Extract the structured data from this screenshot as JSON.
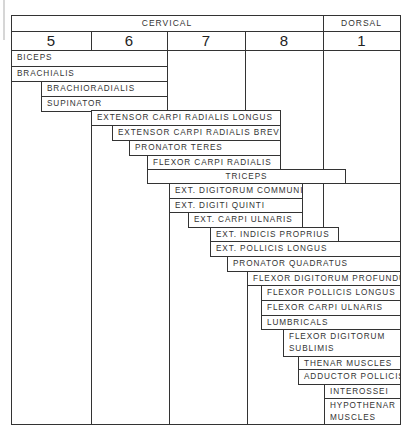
{
  "header": {
    "groups": [
      {
        "label": "CERVICAL",
        "x": 11,
        "w": 312
      },
      {
        "label": "DORSAL",
        "x": 323,
        "w": 77
      }
    ],
    "segments": [
      {
        "label": "5",
        "x": 11,
        "w": 80
      },
      {
        "label": "6",
        "x": 91,
        "w": 76
      },
      {
        "label": "7",
        "x": 167,
        "w": 78
      },
      {
        "label": "8",
        "x": 245,
        "w": 78
      },
      {
        "label": "1",
        "x": 323,
        "w": 77
      }
    ]
  },
  "muscles": [
    {
      "name": "BICEPS",
      "x1": 11,
      "x2": 167,
      "y": 50,
      "h": 17,
      "segments": "C5-C6"
    },
    {
      "name": "BRACHIALIS",
      "x1": 11,
      "x2": 167,
      "y": 66,
      "h": 16,
      "segments": "C5-C6"
    },
    {
      "name": "BRACHIORADIALIS",
      "x1": 41,
      "x2": 167,
      "y": 81,
      "h": 16,
      "segments": "C5-C6"
    },
    {
      "name": "SUPINATOR",
      "x1": 41,
      "x2": 167,
      "y": 96,
      "h": 16,
      "segments": "C5-C6"
    },
    {
      "name": "EXTENSOR CARPI RADIALIS LONGUS",
      "x1": 91,
      "x2": 280,
      "y": 110,
      "h": 16,
      "segments": "C6-C7"
    },
    {
      "name": "EXTENSOR CARPI RADIALIS BREVIS",
      "x1": 112,
      "x2": 280,
      "y": 125,
      "h": 16,
      "segments": "C6-C7"
    },
    {
      "name": "PRONATOR TERES",
      "x1": 129,
      "x2": 280,
      "y": 140,
      "h": 16,
      "segments": "C6-C7"
    },
    {
      "name": "FLEXOR CARPI RADIALIS",
      "x1": 147,
      "x2": 280,
      "y": 155,
      "h": 15,
      "segments": "C6-C7"
    },
    {
      "name": "TRICEPS",
      "x1": 147,
      "x2": 345,
      "y": 169,
      "h": 15,
      "segments": "C6-C8",
      "center": true
    },
    {
      "name": "EXT. DIGITORUM COMMUNIS",
      "x1": 169,
      "x2": 302,
      "y": 183,
      "h": 16,
      "segments": "C7-C8"
    },
    {
      "name": "EXT. DIGITI QUINTI",
      "x1": 169,
      "x2": 302,
      "y": 198,
      "h": 15,
      "segments": "C7-C8"
    },
    {
      "name": "EXT. CARPI ULNARIS",
      "x1": 188,
      "x2": 302,
      "y": 212,
      "h": 16,
      "segments": "C7-C8"
    },
    {
      "name": "EXT. INDICIS PROPRIUS",
      "x1": 210,
      "x2": 338,
      "y": 227,
      "h": 15,
      "segments": "C7-C8"
    },
    {
      "name": "EXT. POLLICIS LONGUS",
      "x1": 210,
      "x2": 400,
      "y": 241,
      "h": 16,
      "segments": "C7-T1"
    },
    {
      "name": "PRONATOR QUADRATUS",
      "x1": 227,
      "x2": 400,
      "y": 256,
      "h": 16,
      "segments": "C7-T1"
    },
    {
      "name": "FLEXOR DIGITORUM PROFUNDUS",
      "x1": 247,
      "x2": 400,
      "y": 271,
      "h": 15,
      "segments": "C8-T1"
    },
    {
      "name": "FLEXOR POLLICIS LONGUS",
      "x1": 261,
      "x2": 400,
      "y": 285,
      "h": 16,
      "segments": "C8-T1"
    },
    {
      "name": "FLEXOR CARPI ULNARIS",
      "x1": 261,
      "x2": 400,
      "y": 300,
      "h": 16,
      "segments": "C8-T1"
    },
    {
      "name": "LUMBRICALS",
      "x1": 261,
      "x2": 400,
      "y": 315,
      "h": 15,
      "segments": "C8-T1"
    },
    {
      "name": "FLEXOR DIGITORUM SUBLIMIS",
      "line1": "FLEXOR DIGITORUM",
      "line2": "SUBLIMIS",
      "x1": 283,
      "x2": 400,
      "y": 329,
      "h": 28,
      "segments": "C8-T1",
      "two": true
    },
    {
      "name": "THENAR MUSCLES",
      "x1": 298,
      "x2": 400,
      "y": 356,
      "h": 14,
      "segments": "C8-T1"
    },
    {
      "name": "ADDUCTOR POLLICIS",
      "x1": 298,
      "x2": 400,
      "y": 369,
      "h": 16,
      "segments": "C8-T1"
    },
    {
      "name": "INTEROSSEI",
      "x1": 324,
      "x2": 400,
      "y": 384,
      "h": 15,
      "segments": "T1"
    },
    {
      "name": "HYPOTHENAR MUSCLES",
      "line1": "HYPOTHENAR",
      "line2": "MUSCLES",
      "x1": 324,
      "x2": 400,
      "y": 398,
      "h": 27,
      "segments": "T1",
      "two": true
    }
  ],
  "frame": {
    "left": 11,
    "top": 15,
    "right": 400,
    "bottom": 424,
    "header_bottom": 31,
    "numbers_bottom": 50
  },
  "gridlines": {
    "vertical": [
      {
        "x": 323,
        "y1": 15,
        "y2": 31
      },
      {
        "x": 91,
        "y1": 31,
        "y2": 50
      },
      {
        "x": 167,
        "y1": 31,
        "y2": 110
      },
      {
        "x": 245,
        "y1": 31,
        "y2": 110
      },
      {
        "x": 323,
        "y1": 31,
        "y2": 169
      },
      {
        "x": 41,
        "y1": 81,
        "y2": 111
      },
      {
        "x": 91,
        "y1": 110,
        "y2": 424
      },
      {
        "x": 169,
        "y1": 183,
        "y2": 424
      },
      {
        "x": 323,
        "y1": 183,
        "y2": 241
      },
      {
        "x": 247,
        "y1": 271,
        "y2": 424
      }
    ],
    "horizontal": [
      {
        "y": 183,
        "x1": 345,
        "x2": 400
      }
    ]
  }
}
